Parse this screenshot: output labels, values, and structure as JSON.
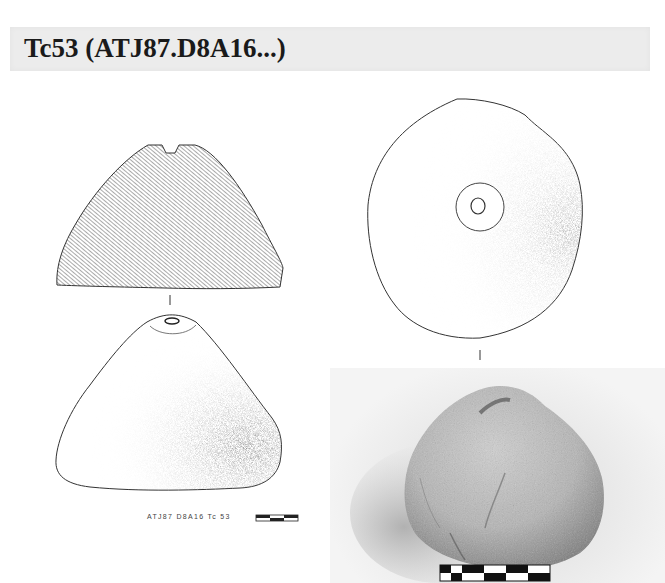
{
  "header": {
    "title": "Tc53 (ATJ87.D8A16...)"
  },
  "drawing": {
    "caption": "ATJ87 D8A16 Tc 53",
    "views": [
      {
        "name": "section-view",
        "label": "Cross-section (hatched)"
      },
      {
        "name": "side-view",
        "label": "Side elevation (stippled)"
      },
      {
        "name": "top-view",
        "label": "Top view with central perforation"
      }
    ],
    "scale_bar_segments": 3
  },
  "photo": {
    "subject": "Clay loom weight / spindle whorl Tc53",
    "scale_bar_segments": 5
  },
  "colors": {
    "header_bg": "#ececec",
    "title_text": "#1a1a1a",
    "line": "#333333",
    "hatch": "#555555"
  }
}
